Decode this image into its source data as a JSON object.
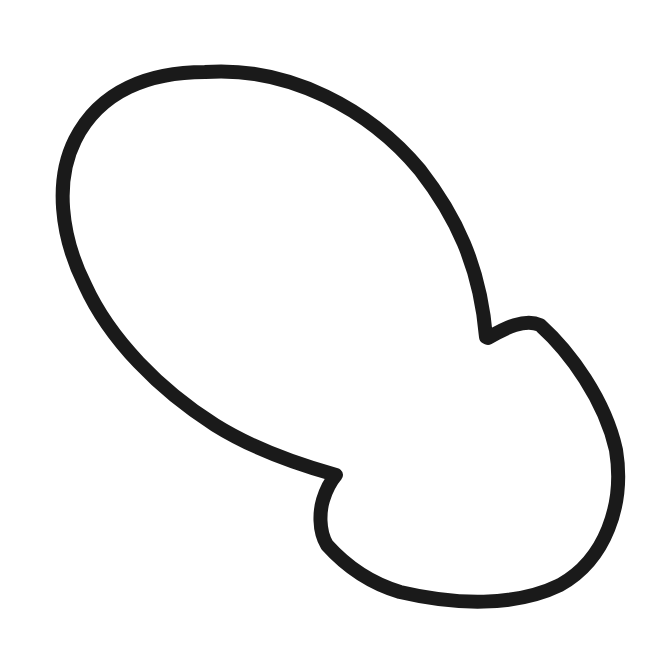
{
  "figure": {
    "stroke_color": "#1a1a1a",
    "background_color": "#ffffff",
    "stroke_width": 14
  }
}
